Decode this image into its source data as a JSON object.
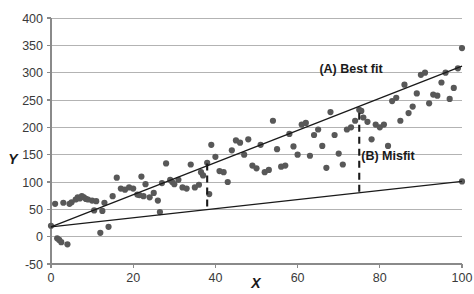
{
  "chart_data": {
    "type": "scatter",
    "title": "",
    "xlabel": "X",
    "ylabel": "Y",
    "xlim": [
      0,
      100
    ],
    "ylim": [
      -50,
      400
    ],
    "xticks": [
      0,
      20,
      40,
      60,
      80,
      100
    ],
    "yticks": [
      -50,
      0,
      50,
      100,
      150,
      200,
      250,
      300,
      350,
      400
    ],
    "grid": "horizontal",
    "legend_position": "inline-annotations",
    "point_color": "#585858",
    "line_color": "#1a1a1a",
    "grid_color": "#b3b3b3",
    "annotations": [
      {
        "id": "best-fit-label",
        "text": "(A) Best fit",
        "x": 73,
        "y": 300
      },
      {
        "id": "misfit-label",
        "text": "(B) Misfit",
        "x": 82,
        "y": 140
      }
    ],
    "series": [
      {
        "name": "Best fit",
        "type": "line",
        "label": "(A) Best fit",
        "x": [
          0,
          100
        ],
        "values": [
          18,
          312
        ]
      },
      {
        "name": "Misfit",
        "type": "line",
        "label": "(B) Misfit",
        "x": [
          0,
          100
        ],
        "values": [
          18,
          101
        ]
      },
      {
        "name": "Residual gap at x=38",
        "type": "dashed-vertical",
        "x": [
          38,
          38
        ],
        "values": [
          55,
          135
        ]
      },
      {
        "name": "Residual gap at x=75",
        "type": "dashed-vertical",
        "x": [
          75,
          75
        ],
        "values": [
          82,
          232
        ]
      },
      {
        "name": "Observations",
        "type": "scatter",
        "points": [
          [
            0,
            20
          ],
          [
            1,
            60
          ],
          [
            1.5,
            -3
          ],
          [
            2,
            -6
          ],
          [
            2.5,
            -10
          ],
          [
            3,
            62
          ],
          [
            4,
            -14
          ],
          [
            4.5,
            60
          ],
          [
            5,
            63
          ],
          [
            6,
            68
          ],
          [
            6.5,
            72
          ],
          [
            7,
            70
          ],
          [
            7.5,
            74
          ],
          [
            8,
            72
          ],
          [
            8.5,
            69
          ],
          [
            9,
            68
          ],
          [
            10,
            66
          ],
          [
            10.5,
            48
          ],
          [
            11,
            65
          ],
          [
            12,
            7
          ],
          [
            12.5,
            47
          ],
          [
            13,
            62
          ],
          [
            14,
            18
          ],
          [
            15,
            74
          ],
          [
            16,
            108
          ],
          [
            17,
            88
          ],
          [
            18,
            86
          ],
          [
            19,
            90
          ],
          [
            20,
            88
          ],
          [
            21,
            77
          ],
          [
            21.5,
            76
          ],
          [
            22,
            110
          ],
          [
            22.5,
            74
          ],
          [
            23,
            96
          ],
          [
            24,
            72
          ],
          [
            25,
            80
          ],
          [
            26,
            66
          ],
          [
            26.5,
            45
          ],
          [
            27,
            98
          ],
          [
            28,
            134
          ],
          [
            29,
            104
          ],
          [
            29.5,
            100
          ],
          [
            30,
            96
          ],
          [
            31,
            104
          ],
          [
            32,
            90
          ],
          [
            33,
            88
          ],
          [
            34,
            132
          ],
          [
            35,
            90
          ],
          [
            36,
            95
          ],
          [
            36.5,
            118
          ],
          [
            37,
            112
          ],
          [
            38,
            135
          ],
          [
            38.5,
            78
          ],
          [
            39,
            168
          ],
          [
            40,
            146
          ],
          [
            41,
            120
          ],
          [
            42,
            118
          ],
          [
            43,
            100
          ],
          [
            44,
            158
          ],
          [
            45,
            176
          ],
          [
            46,
            172
          ],
          [
            47,
            150
          ],
          [
            48,
            178
          ],
          [
            49,
            130
          ],
          [
            50,
            125
          ],
          [
            51,
            168
          ],
          [
            52,
            118
          ],
          [
            53,
            122
          ],
          [
            54,
            212
          ],
          [
            55,
            160
          ],
          [
            56,
            128
          ],
          [
            57,
            130
          ],
          [
            58,
            188
          ],
          [
            59,
            165
          ],
          [
            60,
            150
          ],
          [
            61,
            205
          ],
          [
            62,
            208
          ],
          [
            63,
            148
          ],
          [
            64,
            186
          ],
          [
            65,
            196
          ],
          [
            66,
            166
          ],
          [
            67,
            126
          ],
          [
            68,
            228
          ],
          [
            69,
            186
          ],
          [
            70,
            152
          ],
          [
            71,
            132
          ],
          [
            72,
            196
          ],
          [
            73,
            200
          ],
          [
            74,
            212
          ],
          [
            75,
            232
          ],
          [
            75.5,
            230
          ],
          [
            76,
            218
          ],
          [
            77,
            210
          ],
          [
            78,
            178
          ],
          [
            79,
            205
          ],
          [
            80,
            200
          ],
          [
            81,
            205
          ],
          [
            82,
            166
          ],
          [
            83,
            248
          ],
          [
            84,
            254
          ],
          [
            85,
            212
          ],
          [
            86,
            278
          ],
          [
            87,
            226
          ],
          [
            88,
            238
          ],
          [
            89,
            262
          ],
          [
            90,
            296
          ],
          [
            91,
            300
          ],
          [
            92,
            244
          ],
          [
            93,
            260
          ],
          [
            94,
            258
          ],
          [
            95,
            282
          ],
          [
            96,
            300
          ],
          [
            97,
            252
          ],
          [
            98,
            272
          ],
          [
            99,
            308
          ],
          [
            100,
            345
          ],
          [
            100,
            101
          ]
        ]
      }
    ]
  }
}
